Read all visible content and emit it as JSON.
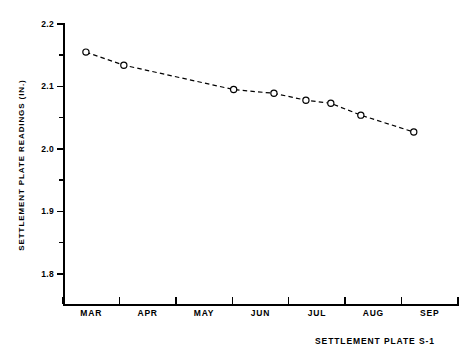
{
  "figure": {
    "caption": "SETTLEMENT PLATE S-1",
    "background": "#ffffff",
    "ink": "#000000"
  },
  "chart_data": {
    "type": "line",
    "title": "",
    "subtitle": "",
    "xlabel": "",
    "ylabel": "SETTLEMENT PLATE READINGS (IN.)",
    "annotation": "SETTLEMENT PLATE S-1",
    "grid": false,
    "legend": null,
    "legend_position": "none",
    "marker": "open-circle",
    "linestyle": "dashed",
    "line_color": "#000000",
    "ylim": [
      1.75,
      2.2
    ],
    "yticks": [
      2.2,
      2.1,
      2.0,
      1.9,
      1.8
    ],
    "ytick_labels": [
      "2.2",
      "2.1",
      "2.0",
      "1.9",
      "1.8"
    ],
    "yminor_ticks": [
      2.15,
      2.05,
      1.95,
      1.85
    ],
    "xlim": [
      "MAR-start",
      "SEP-end"
    ],
    "xtick_labels": [
      "MAR",
      "APR",
      "MAY",
      "JUN",
      "JUL",
      "AUG",
      "SEP"
    ],
    "x_category_count": 7,
    "x": [
      "Mar 10",
      "Mar 27",
      "May 12",
      "Jun 1",
      "Jun 15",
      "Jun 26",
      "Jul 19",
      "Aug 23"
    ],
    "values": [
      2.155,
      2.134,
      2.095,
      2.089,
      2.078,
      2.073,
      2.054,
      2.027
    ],
    "points": [
      {
        "x_frac": 0.058,
        "y": 2.155
      },
      {
        "x_frac": 0.154,
        "y": 2.134
      },
      {
        "x_frac": 0.432,
        "y": 2.095
      },
      {
        "x_frac": 0.534,
        "y": 2.089
      },
      {
        "x_frac": 0.615,
        "y": 2.078
      },
      {
        "x_frac": 0.678,
        "y": 2.073
      },
      {
        "x_frac": 0.754,
        "y": 2.054
      },
      {
        "x_frac": 0.888,
        "y": 2.027
      }
    ]
  }
}
